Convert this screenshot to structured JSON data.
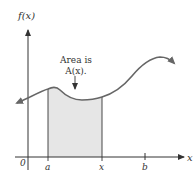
{
  "figure": {
    "y_axis_label": "f(x)",
    "x_axis_label": "x",
    "origin_label": "0",
    "tick_labels": {
      "a": "a",
      "x": "x",
      "b": "b"
    },
    "annotation_line1": "Area is",
    "annotation_line2": "A(x).",
    "colors": {
      "axis": "#333333",
      "curve": "#666666",
      "shaded_area": "#e6e6e6"
    }
  }
}
